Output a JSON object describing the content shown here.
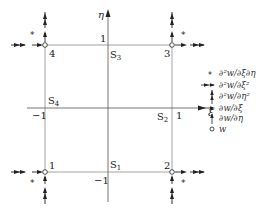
{
  "diagram": {
    "type": "finite-element-node-dof-diagram",
    "axes": {
      "xi": {
        "label": "ξ",
        "min_label": "−1",
        "max_label": "1"
      },
      "eta": {
        "label": "η",
        "min_label": "−1",
        "max_label": "1"
      }
    },
    "nodes": [
      {
        "id": "1",
        "label": "1",
        "position": "bottom-left"
      },
      {
        "id": "2",
        "label": "2",
        "position": "bottom-right"
      },
      {
        "id": "3",
        "label": "3",
        "position": "top-right"
      },
      {
        "id": "4",
        "label": "4",
        "position": "top-left"
      }
    ],
    "sides": [
      {
        "id": "S1",
        "label": "S",
        "sub": "1"
      },
      {
        "id": "S2",
        "label": "S",
        "sub": "2"
      },
      {
        "id": "S3",
        "label": "S",
        "sub": "3"
      },
      {
        "id": "S4",
        "label": "S",
        "sub": "4"
      }
    ],
    "legend": [
      {
        "symbol": "asterisk",
        "glyph": "*",
        "label": "∂²w/∂ξ∂η"
      },
      {
        "symbol": "double-horizontal-arrow",
        "glyph": "⇉",
        "label": "∂²w/∂ξ²"
      },
      {
        "symbol": "double-vertical-arrow",
        "glyph": "⇈",
        "label": "∂²w/∂η²"
      },
      {
        "symbol": "single-horizontal-arrow",
        "glyph": "→",
        "label": "∂w/∂ξ"
      },
      {
        "symbol": "single-vertical-arrow",
        "glyph": "↑",
        "label": "∂w/∂η"
      },
      {
        "symbol": "circle",
        "glyph": "○",
        "label": "w"
      }
    ],
    "colors": {
      "line": "#888888",
      "arrow": "#222222",
      "text": "#222222"
    }
  }
}
